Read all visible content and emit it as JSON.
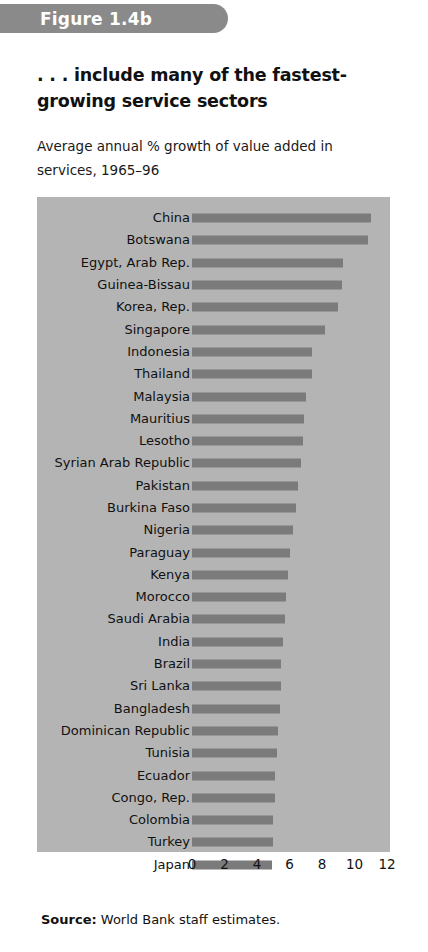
{
  "figure": {
    "banner_label": "Figure 1.4b",
    "headline": ". . . include many of the fastest-growing service sectors",
    "subtitle": "Average annual % growth of value added in services, 1965–96",
    "source_prefix": "Source:",
    "source_text": "World Bank staff estimates.",
    "panel_color": "#b4b4b4",
    "bar_color": "#7b7b7b",
    "banner_color": "#8a8a8a"
  },
  "chart_data": {
    "type": "bar",
    "orientation": "horizontal",
    "title": ". . . include many of the fastest-growing service sectors",
    "subtitle": "Average annual % growth of value added in services, 1965–96",
    "xlabel": "",
    "ylabel": "",
    "xlim": [
      0,
      12
    ],
    "xticks": [
      0,
      2,
      4,
      6,
      8,
      10,
      12
    ],
    "xtick_labels": [
      "0",
      "2",
      "4",
      "6",
      "8",
      "10",
      "12"
    ],
    "grid": false,
    "legend": false,
    "categories": [
      "China",
      "Botswana",
      "Egypt, Arab Rep.",
      "Guinea-Bissau",
      "Korea, Rep.",
      "Singapore",
      "Indonesia",
      "Thailand",
      "Malaysia",
      "Mauritius",
      "Lesotho",
      "Syrian Arab Republic",
      "Pakistan",
      "Burkina Faso",
      "Nigeria",
      "Paraguay",
      "Kenya",
      "Morocco",
      "Saudi Arabia",
      "India",
      "Brazil",
      "Sri Lanka",
      "Bangladesh",
      "Dominican Republic",
      "Tunisia",
      "Ecuador",
      "Congo, Rep.",
      "Colombia",
      "Turkey",
      "Japan"
    ],
    "values": [
      11.0,
      10.8,
      9.3,
      9.2,
      9.0,
      8.2,
      7.4,
      7.4,
      7.0,
      6.9,
      6.8,
      6.7,
      6.5,
      6.4,
      6.2,
      6.0,
      5.9,
      5.8,
      5.7,
      5.6,
      5.5,
      5.5,
      5.4,
      5.3,
      5.2,
      5.1,
      5.1,
      5.0,
      5.0,
      4.9
    ],
    "source": "World Bank staff estimates."
  }
}
